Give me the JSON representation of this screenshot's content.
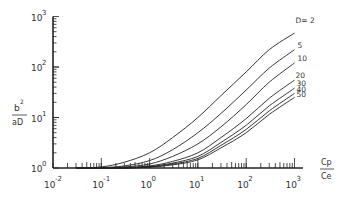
{
  "chart_data": {
    "type": "line",
    "title": "",
    "xlabel": "Cp / Ce",
    "ylabel": "b^2 / aD",
    "xscale": "log",
    "yscale": "log",
    "xlim": [
      0.01,
      1000
    ],
    "ylim": [
      1,
      1000
    ],
    "grid": false,
    "x_ticks": [
      "10^-2",
      "10^-1",
      "10^0",
      "10^1",
      "10^2",
      "10^3"
    ],
    "y_ticks": [
      "10^0",
      "10^1",
      "10^2",
      "10^3"
    ],
    "legend_position": "inline labels at right end of curves",
    "legend_prefix": "D=",
    "x": [
      0.1,
      0.3,
      1,
      3,
      10,
      30,
      100,
      300,
      1000
    ],
    "series": [
      {
        "name": "D=2",
        "label": "D= 2",
        "values": [
          1.05,
          1.3,
          2.0,
          4.0,
          10,
          27,
          80,
          220,
          470
        ]
      },
      {
        "name": "D=5",
        "label": "5",
        "values": [
          1.02,
          1.1,
          1.4,
          2.3,
          5,
          12,
          35,
          95,
          220
        ]
      },
      {
        "name": "D=10",
        "label": "10",
        "values": [
          1.0,
          1.05,
          1.2,
          1.7,
          3,
          6.5,
          18,
          50,
          120
        ]
      },
      {
        "name": "D=20",
        "label": "20",
        "values": [
          1.0,
          1.02,
          1.1,
          1.35,
          2,
          4,
          9.5,
          24,
          55
        ]
      },
      {
        "name": "D=30",
        "label": "30",
        "values": [
          1.0,
          1.0,
          1.07,
          1.25,
          1.7,
          3.2,
          7,
          17,
          38
        ]
      },
      {
        "name": "D=40",
        "label": "40",
        "values": [
          1.0,
          1.0,
          1.05,
          1.2,
          1.55,
          2.8,
          5.8,
          13.5,
          30
        ]
      },
      {
        "name": "D=50",
        "label": "50",
        "values": [
          1.0,
          1.0,
          1.04,
          1.15,
          1.45,
          2.5,
          5,
          11.5,
          25
        ]
      }
    ]
  },
  "labels": {
    "y_num": "b",
    "y_num_exp": "2",
    "y_den": "aD",
    "x_num": "Cp",
    "x_den": "Ce",
    "ticks_x": [
      {
        "base": "10",
        "exp": "-2"
      },
      {
        "base": "10",
        "exp": "-1"
      },
      {
        "base": "10",
        "exp": "0"
      },
      {
        "base": "10",
        "exp": "1"
      },
      {
        "base": "10",
        "exp": "2"
      },
      {
        "base": "10",
        "exp": "3"
      }
    ],
    "ticks_y": [
      {
        "base": "10",
        "exp": "0"
      },
      {
        "base": "10",
        "exp": "1"
      },
      {
        "base": "10",
        "exp": "2"
      },
      {
        "base": "10",
        "exp": "3"
      }
    ]
  },
  "colors": {
    "line": "#222222",
    "text": "#333333",
    "background": "#ffffff"
  }
}
